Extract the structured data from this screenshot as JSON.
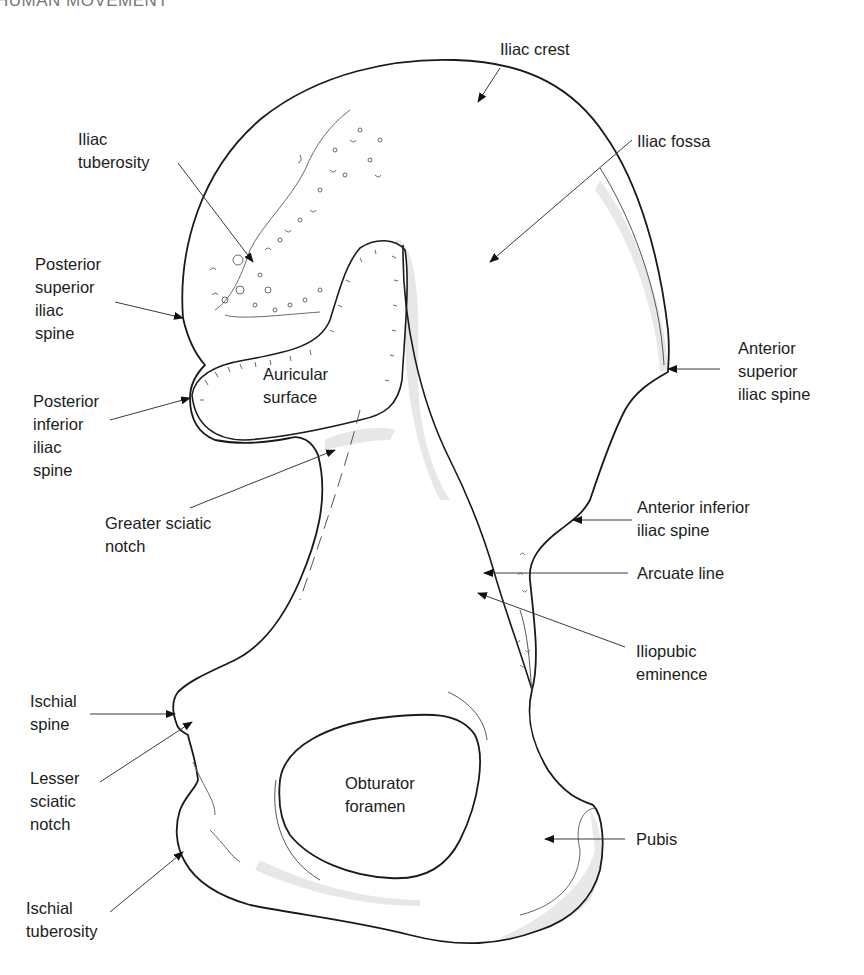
{
  "header": {
    "running_title": "HUMAN MOVEMENT"
  },
  "diagram": {
    "labels": {
      "iliac_crest": "Iliac crest",
      "iliac_tuberosity": "Iliac\ntuberosity",
      "iliac_fossa": "Iliac fossa",
      "posterior_superior_iliac_spine": "Posterior\nsuperior\niliac\nspine",
      "posterior_inferior_iliac_spine": "Posterior\ninferior\niliac\nspine",
      "auricular_surface": "Auricular\nsurface",
      "anterior_superior_iliac_spine": "Anterior\nsuperior\niliac spine",
      "anterior_inferior_iliac_spine": "Anterior inferior\niliac spine",
      "greater_sciatic_notch": "Greater sciatic\nnotch",
      "arcuate_line": "Arcuate line",
      "iliopubic_eminence": "Iliopubic\neminence",
      "ischial_spine": "Ischial\nspine",
      "lesser_sciatic_notch": "Lesser\nsciatic\nnotch",
      "obturator_foramen": "Obturator\nforamen",
      "pubis": "Pubis",
      "ischial_tuberosity": "Ischial\ntuberosity"
    },
    "colors": {
      "outline": "#1a1a1a",
      "leader": "#444444",
      "shade": "#d9d9d9"
    }
  }
}
